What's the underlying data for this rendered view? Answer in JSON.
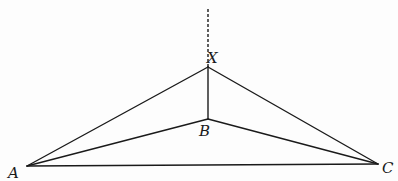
{
  "diagram": {
    "type": "geometric-figure",
    "colors": {
      "line": "#1a1a1a",
      "background": "#fdfdfd"
    },
    "points": {
      "A": {
        "label": "A",
        "x": 27,
        "y": 166,
        "label_x": 8,
        "label_y": 178
      },
      "B": {
        "label": "B",
        "x": 208,
        "y": 119,
        "label_x": 199,
        "label_y": 136
      },
      "C": {
        "label": "C",
        "x": 378,
        "y": 164,
        "label_x": 382,
        "label_y": 173
      },
      "X": {
        "label": "X",
        "x": 208,
        "y": 67,
        "label_x": 207,
        "label_y": 63
      }
    },
    "segments": [
      {
        "from": "A",
        "to": "X",
        "style": "solid"
      },
      {
        "from": "X",
        "to": "C",
        "style": "solid"
      },
      {
        "from": "A",
        "to": "B",
        "style": "solid"
      },
      {
        "from": "B",
        "to": "C",
        "style": "solid"
      },
      {
        "from": "A",
        "to": "C",
        "style": "solid"
      },
      {
        "from": "X",
        "to": "B",
        "style": "solid"
      }
    ],
    "extension": {
      "from": "X",
      "to_x": 208,
      "to_y": 8,
      "style": "dashed"
    }
  }
}
